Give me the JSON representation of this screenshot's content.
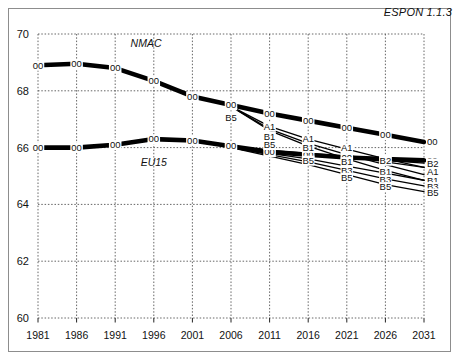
{
  "figure": {
    "source_note": "ESPON 1.1.3"
  },
  "chart_data": {
    "type": "line",
    "title": "",
    "xlabel": "",
    "ylabel": "",
    "xlim": [
      1981,
      2031
    ],
    "ylim": [
      60,
      70
    ],
    "xticks": [
      1981,
      1986,
      1991,
      1996,
      2001,
      2006,
      2011,
      2016,
      2021,
      2026,
      2031
    ],
    "yticks": [
      60,
      62,
      64,
      66,
      68,
      70
    ],
    "grid": true,
    "legend": "inline-labels",
    "group_labels": [
      {
        "text": "NMAC",
        "x": 1995,
        "y": 69.55
      },
      {
        "text": "EU15",
        "x": 1996,
        "y": 65.35
      }
    ],
    "series": [
      {
        "name": "NMAC 00",
        "code": "00",
        "group": "NMAC",
        "weight": "thick",
        "x": [
          1981,
          1986,
          1991,
          1996,
          2001,
          2006,
          2011,
          2016,
          2021,
          2026,
          2031
        ],
        "values": [
          68.9,
          68.95,
          68.8,
          68.35,
          67.8,
          67.5,
          67.2,
          66.95,
          66.7,
          66.45,
          66.2
        ]
      },
      {
        "name": "EU15 00",
        "code": "00",
        "group": "EU15",
        "weight": "thick",
        "x": [
          1981,
          1986,
          1991,
          1996,
          2001,
          2006,
          2011,
          2016,
          2021,
          2026,
          2031
        ],
        "values": [
          66.0,
          66.0,
          66.1,
          66.3,
          66.25,
          66.05,
          65.85,
          65.75,
          65.65,
          65.6,
          65.55
        ]
      },
      {
        "name": "NMAC B5",
        "code": "B5",
        "group": "NMAC",
        "weight": "thin",
        "x": [
          2006,
          2011,
          2016,
          2021,
          2026,
          2031
        ],
        "values": [
          67.45,
          66.6,
          66.05,
          65.6,
          65.2,
          64.85
        ]
      },
      {
        "name": "NMAC A1",
        "code": "A1",
        "group": "NMAC",
        "weight": "thin",
        "x": [
          2006,
          2011,
          2016,
          2021,
          2026,
          2031
        ],
        "values": [
          67.45,
          66.75,
          66.3,
          65.95,
          65.6,
          65.3
        ]
      },
      {
        "name": "NMAC B1",
        "code": "B1",
        "group": "NMAC",
        "weight": "thin",
        "x": [
          2006,
          2011,
          2016,
          2021,
          2026,
          2031
        ],
        "values": [
          67.45,
          66.65,
          66.15,
          65.75,
          65.4,
          65.05
        ]
      },
      {
        "name": "EU15 A1",
        "code": "A1",
        "group": "EU15",
        "weight": "thin",
        "x": [
          2006,
          2011,
          2016,
          2021,
          2026,
          2031
        ],
        "values": [
          66.05,
          65.9,
          65.8,
          65.7,
          65.5,
          65.3
        ]
      },
      {
        "name": "EU15 B2",
        "code": "B2",
        "group": "EU15",
        "weight": "thin",
        "x": [
          2006,
          2011,
          2016,
          2021,
          2026,
          2031
        ],
        "values": [
          66.05,
          65.88,
          65.75,
          65.65,
          65.55,
          65.45
        ]
      },
      {
        "name": "EU15 B1",
        "code": "B1",
        "group": "EU15",
        "weight": "thin",
        "x": [
          2006,
          2011,
          2016,
          2021,
          2026,
          2031
        ],
        "values": [
          66.0,
          65.8,
          65.6,
          65.35,
          65.1,
          64.85
        ]
      },
      {
        "name": "EU15 B3",
        "code": "B3",
        "group": "EU15",
        "weight": "thin",
        "x": [
          2006,
          2011,
          2016,
          2021,
          2026,
          2031
        ],
        "values": [
          66.0,
          65.75,
          65.5,
          65.2,
          64.9,
          64.65
        ]
      },
      {
        "name": "EU15 B5",
        "code": "B5",
        "group": "EU15",
        "weight": "thin",
        "x": [
          2006,
          2011,
          2016,
          2021,
          2026,
          2031
        ],
        "values": [
          66.0,
          65.7,
          65.4,
          65.05,
          64.7,
          64.45
        ]
      }
    ],
    "point_labels": [
      {
        "text": "00",
        "x": 1981,
        "y": 68.9,
        "anchor": "middle"
      },
      {
        "text": "00",
        "x": 1986,
        "y": 68.95,
        "anchor": "middle"
      },
      {
        "text": "00",
        "x": 1991,
        "y": 68.8,
        "anchor": "middle"
      },
      {
        "text": "00",
        "x": 1996,
        "y": 68.35,
        "anchor": "middle"
      },
      {
        "text": "00",
        "x": 2001,
        "y": 67.8,
        "anchor": "middle"
      },
      {
        "text": "00",
        "x": 2006,
        "y": 67.5,
        "anchor": "middle"
      },
      {
        "text": "00",
        "x": 2011,
        "y": 67.2,
        "anchor": "middle"
      },
      {
        "text": "00",
        "x": 2016,
        "y": 66.95,
        "anchor": "middle"
      },
      {
        "text": "00",
        "x": 2021,
        "y": 66.7,
        "anchor": "middle"
      },
      {
        "text": "00",
        "x": 2026,
        "y": 66.45,
        "anchor": "middle"
      },
      {
        "text": "00",
        "x": 2031,
        "y": 66.2,
        "anchor": "start"
      },
      {
        "text": "00",
        "x": 1981,
        "y": 66.0,
        "anchor": "middle"
      },
      {
        "text": "00",
        "x": 1986,
        "y": 66.0,
        "anchor": "middle"
      },
      {
        "text": "00",
        "x": 1991,
        "y": 66.1,
        "anchor": "middle"
      },
      {
        "text": "00",
        "x": 1996,
        "y": 66.3,
        "anchor": "middle"
      },
      {
        "text": "00",
        "x": 2001,
        "y": 66.25,
        "anchor": "middle"
      },
      {
        "text": "00",
        "x": 2006,
        "y": 66.05,
        "anchor": "middle"
      },
      {
        "text": "00",
        "x": 2011,
        "y": 65.85,
        "anchor": "middle"
      },
      {
        "text": "00",
        "x": 2016,
        "y": 65.75,
        "anchor": "middle"
      },
      {
        "text": "00",
        "x": 2021,
        "y": 65.65,
        "anchor": "middle"
      },
      {
        "text": "00",
        "x": 2026,
        "y": 65.6,
        "anchor": "middle"
      },
      {
        "text": "00",
        "x": 2031,
        "y": 65.55,
        "anchor": "start"
      },
      {
        "text": "B5",
        "x": 2006,
        "y": 67.05,
        "anchor": "middle"
      },
      {
        "text": "A1",
        "x": 2011,
        "y": 66.75,
        "anchor": "middle"
      },
      {
        "text": "B1",
        "x": 2011,
        "y": 66.4,
        "anchor": "middle"
      },
      {
        "text": "B5",
        "x": 2011,
        "y": 66.1,
        "anchor": "middle"
      },
      {
        "text": "A1",
        "x": 2016,
        "y": 66.3,
        "anchor": "middle"
      },
      {
        "text": "B1",
        "x": 2016,
        "y": 66.0,
        "anchor": "middle"
      },
      {
        "text": "B5",
        "x": 2016,
        "y": 65.55,
        "anchor": "middle"
      },
      {
        "text": "A1",
        "x": 2021,
        "y": 65.98,
        "anchor": "middle"
      },
      {
        "text": "B1",
        "x": 2021,
        "y": 65.5,
        "anchor": "middle"
      },
      {
        "text": "B3",
        "x": 2021,
        "y": 65.2,
        "anchor": "middle"
      },
      {
        "text": "B5",
        "x": 2021,
        "y": 64.95,
        "anchor": "middle"
      },
      {
        "text": "B2",
        "x": 2026,
        "y": 65.55,
        "anchor": "middle"
      },
      {
        "text": "B1",
        "x": 2026,
        "y": 65.15,
        "anchor": "middle"
      },
      {
        "text": "B3",
        "x": 2026,
        "y": 64.88,
        "anchor": "middle"
      },
      {
        "text": "B5",
        "x": 2026,
        "y": 64.62,
        "anchor": "middle"
      },
      {
        "text": "B2",
        "x": 2031,
        "y": 65.45,
        "anchor": "start"
      },
      {
        "text": "A1",
        "x": 2031,
        "y": 65.15,
        "anchor": "start"
      },
      {
        "text": "B1",
        "x": 2031,
        "y": 64.85,
        "anchor": "start"
      },
      {
        "text": "B3",
        "x": 2031,
        "y": 64.62,
        "anchor": "start"
      },
      {
        "text": "B5",
        "x": 2031,
        "y": 64.4,
        "anchor": "start"
      }
    ]
  }
}
